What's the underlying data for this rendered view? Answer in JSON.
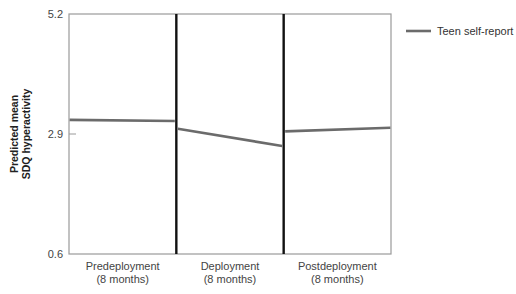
{
  "chart_data": {
    "type": "line",
    "title": "",
    "ylabel": "Predicted mean SDQ hyperactivity",
    "ylabel_lines": [
      "Predicted mean",
      "SDQ hyperactivity"
    ],
    "xlabel": "",
    "ylim": [
      0.6,
      5.2
    ],
    "yticks": [
      0.6,
      2.9,
      5.2
    ],
    "ytick_labels": [
      "0.6",
      "2.9",
      "5.2"
    ],
    "grid": false,
    "legend_position": "right",
    "categories": [
      {
        "line1": "Predeployment",
        "line2": "(8 months)"
      },
      {
        "line1": "Deployment",
        "line2": "(8 months)"
      },
      {
        "line1": "Postdeployment",
        "line2": "(8 months)"
      }
    ],
    "series": [
      {
        "name": "Teen self-report",
        "color": "#6b6b6b",
        "segments": [
          {
            "period": "Predeployment",
            "start": 3.17,
            "end": 3.15
          },
          {
            "period": "Deployment",
            "start": 3.0,
            "end": 2.67
          },
          {
            "period": "Postdeployment",
            "start": 2.95,
            "end": 3.02
          }
        ]
      }
    ]
  },
  "legend": {
    "items": [
      {
        "label": "Teen self-report",
        "color": "#6b6b6b"
      }
    ]
  },
  "axis": {
    "frame_color": "#9a9a9a",
    "divider_color": "#111111"
  }
}
